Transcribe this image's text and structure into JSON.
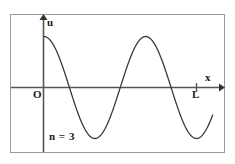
{
  "figure": {
    "name": "standing-wave-n3",
    "background_color": "#ffffff",
    "border_color": "#9a9a9a",
    "axis_color": "#555555",
    "curve_color": "#3a3a3a",
    "text_color": "#1a1a1a",
    "labels": {
      "y_axis": "u",
      "x_axis": "x",
      "origin": "O",
      "length": "L",
      "mode": "n = 3"
    }
  },
  "chart_data": {
    "type": "line",
    "title": "",
    "subtitle": "",
    "xlabel": "x",
    "ylabel": "u",
    "grid": false,
    "legend": null,
    "annotations": [
      {
        "text": "n = 3",
        "x": 0.05,
        "y": -0.85
      },
      {
        "text": "O",
        "x": 0.0,
        "y": -0.12
      },
      {
        "text": "L",
        "x": 1.0,
        "y": -0.12
      }
    ],
    "axis_ticks": {
      "x": [
        "O",
        "L"
      ],
      "y": []
    },
    "xlim": [
      -0.02,
      1.18
    ],
    "ylim": [
      -1.25,
      1.25
    ],
    "series": [
      {
        "name": "n = 3 harmonic",
        "function": "cos(3*pi*x)",
        "harmonic_number": 3,
        "amplitude": 1.0,
        "x": [
          0.0,
          0.05,
          0.1,
          0.15,
          0.17,
          0.2,
          0.25,
          0.3,
          0.33,
          0.35,
          0.4,
          0.45,
          0.5,
          0.5,
          0.55,
          0.6,
          0.65,
          0.67,
          0.7,
          0.75,
          0.8,
          0.83,
          0.85,
          0.9,
          0.95,
          1.0,
          1.05,
          1.1
        ],
        "values": [
          1.0,
          0.97,
          0.89,
          0.73,
          0.66,
          0.45,
          0.14,
          -0.16,
          -0.33,
          -0.45,
          -0.73,
          -0.92,
          -1.0,
          -1.0,
          -0.92,
          -0.73,
          -0.45,
          -0.33,
          -0.16,
          0.14,
          0.45,
          0.66,
          0.73,
          0.89,
          0.97,
          1.0,
          0.89,
          0.45
        ]
      }
    ],
    "key_points": {
      "crest_1_x": 0.0,
      "trough_1_x": 0.5,
      "crest_2_x": 1.0,
      "zero_crossings_x": [
        0.1667,
        0.8333,
        1.5
      ]
    }
  }
}
